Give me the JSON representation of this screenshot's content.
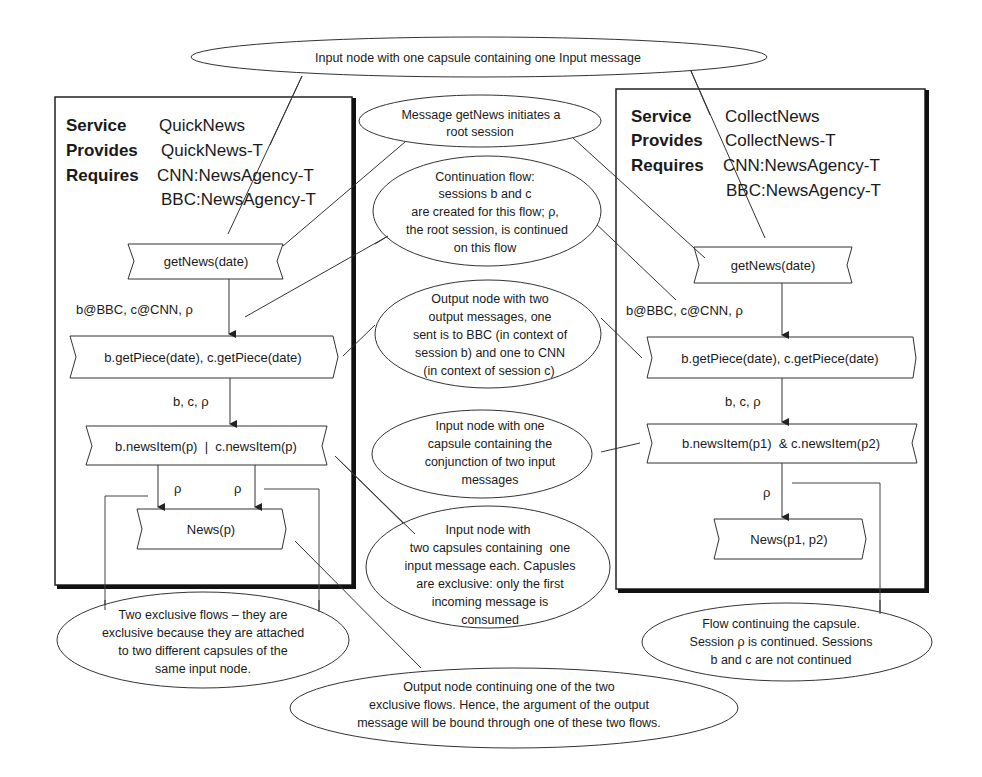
{
  "diagram": {
    "left_service": {
      "service_kw": "Service",
      "service_name": "QuickNews",
      "provides_kw": "Provides",
      "provides_value": "QuickNews-T",
      "requires_kw": "Requires",
      "requires_values": [
        "CNN:NewsAgency-T",
        "BBC:NewsAgency-T"
      ],
      "nodes": {
        "get_news": "getNews(date)",
        "get_piece": "b.getPiece(date), c.getPiece(date)",
        "news_item": "b.newsItem(p)  |  c.newsItem(p)",
        "news": "News(p)"
      },
      "flow_labels": {
        "after_get_news": "b@BBC, c@CNN, ρ",
        "after_get_piece": "b, c, ρ",
        "left_branch": "ρ",
        "right_branch": "ρ"
      }
    },
    "right_service": {
      "service_kw": "Service",
      "service_name": "CollectNews",
      "provides_kw": "Provides",
      "provides_value": "CollectNews-T",
      "requires_kw": "Requires",
      "requires_values": [
        "CNN:NewsAgency-T",
        "BBC:NewsAgency-T"
      ],
      "nodes": {
        "get_news": "getNews(date)",
        "get_piece": "b.getPiece(date), c.getPiece(date)",
        "news_item": "b.newsItem(p1)  & c.newsItem(p2)",
        "news": "News(p1, p2)"
      },
      "flow_labels": {
        "after_get_news": "b@BBC, c@CNN, ρ",
        "after_get_piece": "b, c, ρ",
        "after_news_item": "ρ"
      }
    },
    "annotations": {
      "top_input_node": [
        "Input node with one capsule  containing one Input message"
      ],
      "root_session": [
        "Message getNews initiates a",
        "root session"
      ],
      "continuation_flow": [
        "Continuation flow:",
        "sessions b and c",
        "are created for this flow; ρ,",
        "the root session,  is continued",
        "on this flow"
      ],
      "output_node_two": [
        "Output node with two",
        "output messages, one",
        "sent is to BBC (in context of",
        "session b) and one to CNN",
        "(in context of session c)"
      ],
      "input_node_conjunction": [
        "Input node with one",
        "capsule containing the",
        "conjunction of two input",
        "messages"
      ],
      "input_node_two_capsules": [
        "Input node with",
        "two capsules containing  one",
        "input message each. Capusles",
        "are exclusive: only the first",
        "incoming message is",
        "consumed"
      ],
      "two_exclusive_flows": [
        "Two exclusive flows – they are",
        "exclusive because they are attached",
        "to two different capsules of the",
        "same input node."
      ],
      "flow_continuing_capsule": [
        "Flow continuing the capsule.",
        "Session ρ is continued. Sessions",
        "b and c are not continued"
      ],
      "output_node_continuing": [
        "Output node continuing one of the two",
        "exclusive flows. Hence, the argument of the output",
        "message will be bound through one of these two flows."
      ]
    }
  }
}
